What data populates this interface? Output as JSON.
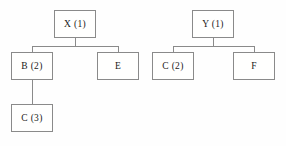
{
  "diagram": {
    "type": "tree-diagram",
    "title": "",
    "background_color": "#fefefe",
    "stroke_color": "#8a8a8a",
    "text_color": "#1a1a1a",
    "trees": [
      {
        "name": "left-tree",
        "root": {
          "label": "X (1)"
        },
        "children": [
          {
            "label": "B (2)",
            "children": [
              {
                "label": "C (3)"
              }
            ]
          },
          {
            "label": "E",
            "children": []
          }
        ]
      },
      {
        "name": "right-tree",
        "root": {
          "label": "Y (1)"
        },
        "children": [
          {
            "label": "C (2)",
            "children": []
          },
          {
            "label": "F",
            "children": []
          }
        ]
      }
    ],
    "nodes": {
      "x1": "X (1)",
      "b2": "B (2)",
      "e": "E",
      "c3": "C (3)",
      "y1": "Y (1)",
      "c2": "C (2)",
      "f": "F"
    }
  }
}
